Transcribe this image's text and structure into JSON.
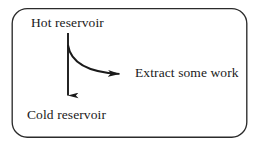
{
  "diagram": {
    "background_color": "#ffffff",
    "stroke_color": "#1a1a1a",
    "border": {
      "shape": "rounded-rectangle",
      "corner_radius": 15,
      "stroke_width": 1.3
    },
    "nodes": [
      {
        "id": "hot",
        "label": "Hot reservoir",
        "x": 31,
        "y": 16
      },
      {
        "id": "cold",
        "label": "Cold reservoir",
        "x": 27,
        "y": 108
      },
      {
        "id": "work",
        "label": "Extract some work",
        "x": 135,
        "y": 66
      }
    ],
    "arrows": [
      {
        "id": "heat-down-arrow",
        "from": "hot",
        "to": "cold",
        "style": "straight-vertical",
        "direction": "down",
        "start": [
          68,
          33
        ],
        "end": [
          68,
          105
        ]
      },
      {
        "id": "work-branch-arrow",
        "from": "hot",
        "to": "work",
        "style": "curved",
        "direction": "right",
        "start": [
          68,
          45
        ],
        "end": [
          132,
          74
        ]
      }
    ]
  }
}
